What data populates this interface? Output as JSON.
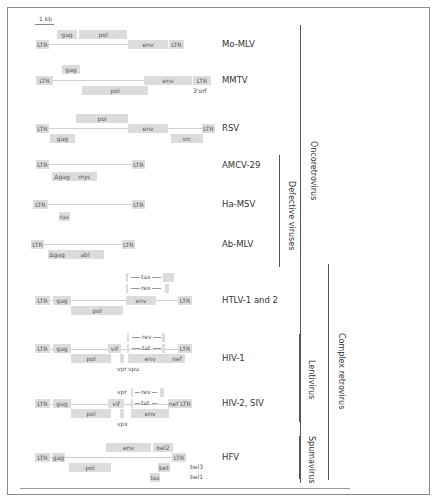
{
  "scale": {
    "label": "1 kb"
  },
  "viruses": [
    {
      "name": "Mo-MLV",
      "genes": [
        "LTR",
        "gag",
        "pol",
        "env",
        "LTR"
      ]
    },
    {
      "name": "MMTV",
      "genes": [
        "LTR",
        "gag",
        "pol",
        "env",
        "LTR",
        "3'orf"
      ]
    },
    {
      "name": "RSV",
      "genes": [
        "LTR",
        "pol",
        "gag",
        "env",
        "src",
        "LTR"
      ]
    },
    {
      "name": "AMCV-29",
      "genes": [
        "LTR",
        "Δgag",
        "myc",
        "LTR"
      ]
    },
    {
      "name": "Ha-MSV",
      "genes": [
        "LTR",
        "ras",
        "LTR"
      ]
    },
    {
      "name": "Ab-MLV",
      "genes": [
        "LTR",
        "Δgag",
        "abl",
        "LTR"
      ]
    },
    {
      "name": "HTLV-1 and 2",
      "genes": [
        "LTR",
        "gag",
        "pol",
        "tax",
        "rex",
        "env",
        "LTR"
      ]
    },
    {
      "name": "HIV-1",
      "genes": [
        "LTR",
        "gag",
        "pol",
        "vif",
        "vpr",
        "vpu",
        "rev",
        "tat",
        "env",
        "nef",
        "LTR"
      ]
    },
    {
      "name": "HIV-2, SIV",
      "genes": [
        "LTR",
        "gag",
        "pol",
        "vif",
        "vpr",
        "vpx",
        "rev",
        "tat",
        "env",
        "nef",
        "LTR"
      ]
    },
    {
      "name": "HFV",
      "genes": [
        "LTR",
        "gag",
        "pol",
        "env",
        "bel2",
        "LTR",
        "bet",
        "tas",
        "bel3",
        "bel1"
      ]
    }
  ],
  "groups": {
    "oncoretrovirus": "Oncoretrovirus",
    "defective": "Defective viruses",
    "complex": "Complex retrovirus",
    "lentivirus": "Lentivirus",
    "spumavirus": "Spumavirus"
  },
  "colors": {
    "gene_box": "#dcdcdc",
    "frame": "#8a8a8a",
    "bracket": "#555555"
  }
}
